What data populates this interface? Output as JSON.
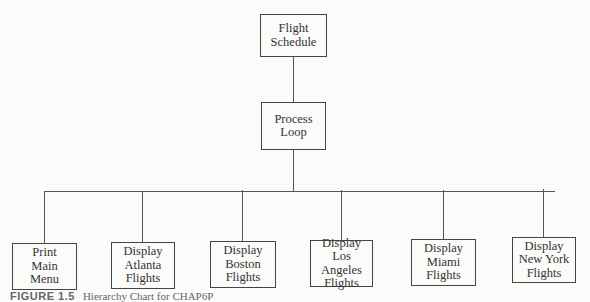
{
  "diagram": {
    "root": {
      "lines": [
        "Flight",
        "Schedule"
      ]
    },
    "middle": {
      "lines": [
        "Process",
        "Loop"
      ]
    },
    "children": [
      {
        "lines": [
          "Print",
          "Main",
          "Menu"
        ]
      },
      {
        "lines": [
          "Display",
          "Atlanta",
          "Flights"
        ]
      },
      {
        "lines": [
          "Display",
          "Boston",
          "Flights"
        ]
      },
      {
        "lines": [
          "Display",
          "Los Angeles",
          "Flights"
        ]
      },
      {
        "lines": [
          "Display",
          "Miami",
          "Flights"
        ]
      },
      {
        "lines": [
          "Display",
          "New York",
          "Flights"
        ]
      }
    ]
  },
  "caption": {
    "label": "FIGURE 1.5",
    "text": "Hierarchy Chart for CHAP6P"
  }
}
